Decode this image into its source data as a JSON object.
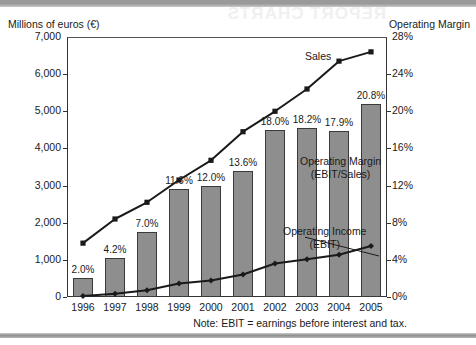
{
  "artifacts": {
    "bleed_text": "REPORT CHARTS"
  },
  "chart_data": {
    "type": "bar",
    "title": "",
    "subtitle": "",
    "categories": [
      "1996",
      "1997",
      "1998",
      "1999",
      "2000",
      "2001",
      "2002",
      "2003",
      "2004",
      "2005"
    ],
    "xlabel": "",
    "ylabel": "Millions of euros (€)",
    "y2label": "Operating Margin",
    "ylim": [
      0,
      7000
    ],
    "y2lim": [
      0,
      28
    ],
    "yticks": [
      "0",
      "1,000",
      "2,000",
      "3,000",
      "4,000",
      "5,000",
      "6,000",
      "7,000"
    ],
    "ytick_values": [
      0,
      1000,
      2000,
      3000,
      4000,
      5000,
      6000,
      7000
    ],
    "y2ticks": [
      "0%",
      "4%",
      "8%",
      "12%",
      "16%",
      "20%",
      "24%",
      "28%"
    ],
    "y2tick_values": [
      0,
      4,
      8,
      12,
      16,
      20,
      24,
      28
    ],
    "grid": false,
    "legend_position": "inline-annotations",
    "series": [
      {
        "name": "Operating Margin (EBIT/Sales)",
        "kind": "bar",
        "axis": "right",
        "unit": "%",
        "values": [
          2.0,
          4.2,
          7.0,
          11.6,
          12.0,
          13.6,
          18.0,
          18.2,
          17.9,
          20.8
        ],
        "labels": [
          "2.0%",
          "4.2%",
          "7.0%",
          "11.6%",
          "12.0%",
          "13.6%",
          "18.0%",
          "18.2%",
          "17.9%",
          "20.8%"
        ],
        "color": "#8e8e8e",
        "border_color": "#3a3a3a"
      },
      {
        "name": "Sales",
        "kind": "line",
        "axis": "left",
        "unit": "Millions of euros",
        "marker": "square",
        "values": [
          1450,
          2100,
          2550,
          3150,
          3680,
          4450,
          5000,
          5600,
          6350,
          6600
        ],
        "color": "#1a1a1a"
      },
      {
        "name": "Operating Income (EBIT)",
        "kind": "line",
        "axis": "left",
        "unit": "Millions of euros",
        "marker": "diamond",
        "values": [
          29,
          88,
          179,
          365,
          442,
          605,
          900,
          1019,
          1137,
          1373
        ],
        "color": "#1a1a1a"
      }
    ],
    "annotations": [
      {
        "id": "sales",
        "text": "Sales"
      },
      {
        "id": "margin",
        "line1": "Operating Margin",
        "line2": "(EBIT/Sales)"
      },
      {
        "id": "ebit",
        "line1": "Operating Income",
        "line2": "(EBIT)"
      }
    ],
    "note": "Note: EBIT = earnings before interest and tax."
  }
}
